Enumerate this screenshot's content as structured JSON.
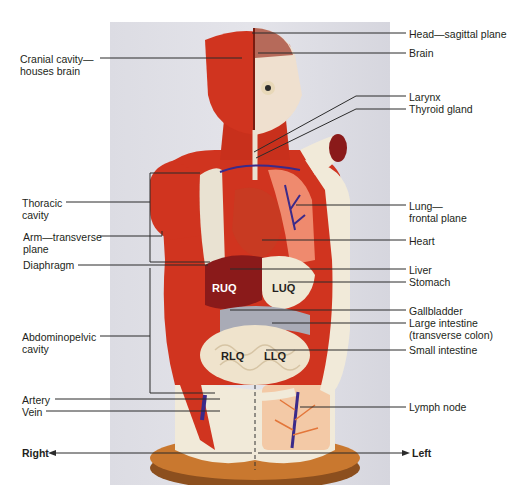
{
  "figure": {
    "type": "anatomical-model-photo"
  },
  "labels_left": [
    {
      "id": "cranial-cavity",
      "lines": [
        "Cranial cavity—",
        "houses brain"
      ]
    },
    {
      "id": "thoracic-cavity",
      "lines": [
        "Thoracic",
        "cavity"
      ]
    },
    {
      "id": "arm-transverse",
      "lines": [
        "Arm—transverse",
        "plane"
      ]
    },
    {
      "id": "diaphragm",
      "lines": [
        "Diaphragm"
      ]
    },
    {
      "id": "abdominopelvic-cavity",
      "lines": [
        "Abdominopelvic",
        "cavity"
      ]
    },
    {
      "id": "artery",
      "lines": [
        "Artery"
      ]
    },
    {
      "id": "vein",
      "lines": [
        "Vein"
      ]
    }
  ],
  "labels_right": [
    {
      "id": "head-sagittal",
      "lines": [
        "Head—sagittal plane"
      ]
    },
    {
      "id": "brain",
      "lines": [
        "Brain"
      ]
    },
    {
      "id": "larynx",
      "lines": [
        "Larynx"
      ]
    },
    {
      "id": "thyroid-gland",
      "lines": [
        "Thyroid gland"
      ]
    },
    {
      "id": "lung-frontal",
      "lines": [
        "Lung—",
        "frontal plane"
      ]
    },
    {
      "id": "heart",
      "lines": [
        "Heart"
      ]
    },
    {
      "id": "liver",
      "lines": [
        "Liver"
      ]
    },
    {
      "id": "stomach",
      "lines": [
        "Stomach"
      ]
    },
    {
      "id": "gallbladder",
      "lines": [
        "Gallbladder"
      ]
    },
    {
      "id": "large-intestine",
      "lines": [
        "Large intestine",
        "(transverse colon)"
      ]
    },
    {
      "id": "small-intestine",
      "lines": [
        "Small intestine"
      ]
    },
    {
      "id": "lymph-node",
      "lines": [
        "Lymph node"
      ]
    }
  ],
  "quadrants": [
    "RUQ",
    "LUQ",
    "RLQ",
    "LLQ"
  ],
  "direction": {
    "right": "Right",
    "left": "Left"
  },
  "colors": {
    "muscle": "#d0341f",
    "liver": "#8a1a1a",
    "lung": "#e9e2d2",
    "stomach": "#efe8d4",
    "colon": "#a9abb6",
    "small_intestine": "#efe3cc",
    "base": "#c9782f",
    "vessel": "#3b2a8a",
    "leader_line": "#2b2b2b",
    "background_photo": "#e0e0e6"
  }
}
